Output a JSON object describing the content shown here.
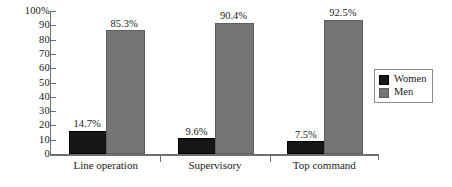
{
  "chart_data": {
    "type": "bar",
    "title": "",
    "subtitle": "",
    "xlabel": "",
    "ylabel": "",
    "ylim": [
      0,
      100
    ],
    "ytick_labels": [
      "100%",
      "90",
      "80",
      "70",
      "60",
      "50",
      "40",
      "30",
      "20",
      "10",
      "0"
    ],
    "ytick_values": [
      100,
      90,
      80,
      70,
      60,
      50,
      40,
      30,
      20,
      10,
      0
    ],
    "grid": false,
    "legend_position": "right",
    "categories": [
      "Line operation",
      "Supervisory",
      "Top command"
    ],
    "series": [
      {
        "name": "Women",
        "color": "#161616",
        "values": [
          14.7,
          9.6,
          7.5
        ],
        "data_labels": [
          "14.7%",
          "9.6%",
          "7.5%"
        ]
      },
      {
        "name": "Men",
        "color": "#757575",
        "values": [
          85.3,
          90.4,
          92.5
        ],
        "data_labels": [
          "85.3%",
          "90.4%",
          "92.5%"
        ]
      }
    ]
  },
  "legend": {
    "entries": [
      {
        "label": "Women",
        "swatch": "women"
      },
      {
        "label": "Men",
        "swatch": "men"
      }
    ]
  }
}
